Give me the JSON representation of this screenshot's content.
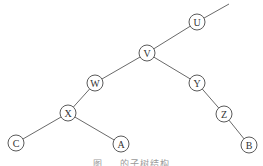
{
  "diagram": {
    "type": "binary-tree",
    "node_radius": 8,
    "colors": {
      "edge": "#6a6a6a",
      "node_stroke": "#5a5a5a",
      "label": "#333333",
      "background": "#ffffff"
    },
    "nodes": [
      {
        "id": "U",
        "label": "U",
        "x": 197,
        "y": 22
      },
      {
        "id": "V",
        "label": "V",
        "x": 147,
        "y": 53
      },
      {
        "id": "W",
        "label": "W",
        "x": 95,
        "y": 83
      },
      {
        "id": "Y",
        "label": "Y",
        "x": 197,
        "y": 83
      },
      {
        "id": "X",
        "label": "X",
        "x": 68,
        "y": 113
      },
      {
        "id": "Z",
        "label": "Z",
        "x": 224,
        "y": 114
      },
      {
        "id": "C",
        "label": "C",
        "x": 16,
        "y": 143
      },
      {
        "id": "A",
        "label": "A",
        "x": 121,
        "y": 144
      },
      {
        "id": "B",
        "label": "B",
        "x": 249,
        "y": 145
      }
    ],
    "edges": [
      {
        "from": "U",
        "to": "V"
      },
      {
        "from": "V",
        "to": "W"
      },
      {
        "from": "V",
        "to": "Y"
      },
      {
        "from": "W",
        "to": "X"
      },
      {
        "from": "X",
        "to": "C"
      },
      {
        "from": "X",
        "to": "A"
      },
      {
        "from": "Y",
        "to": "Z"
      },
      {
        "from": "Z",
        "to": "B"
      }
    ],
    "parent_stub": {
      "from": "U",
      "to_x": 229,
      "to_y": 4
    },
    "caption": "图 … 的子树结构"
  }
}
